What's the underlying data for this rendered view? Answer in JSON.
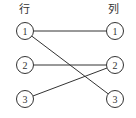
{
  "headers": {
    "left": "行",
    "right": "列"
  },
  "left_nodes": [
    {
      "label": "1",
      "cx": 25,
      "cy": 31
    },
    {
      "label": "2",
      "cx": 25,
      "cy": 65
    },
    {
      "label": "3",
      "cx": 25,
      "cy": 99
    }
  ],
  "right_nodes": [
    {
      "label": "1",
      "cx": 115,
      "cy": 31
    },
    {
      "label": "2",
      "cx": 115,
      "cy": 65
    },
    {
      "label": "3",
      "cx": 115,
      "cy": 99
    }
  ],
  "edges": [
    {
      "from": "left-1",
      "to": "right-1"
    },
    {
      "from": "left-1",
      "to": "right-3"
    },
    {
      "from": "left-2",
      "to": "right-2"
    },
    {
      "from": "left-3",
      "to": "right-2"
    }
  ],
  "colors": {
    "stroke": "#333333",
    "background": "#ffffff"
  }
}
